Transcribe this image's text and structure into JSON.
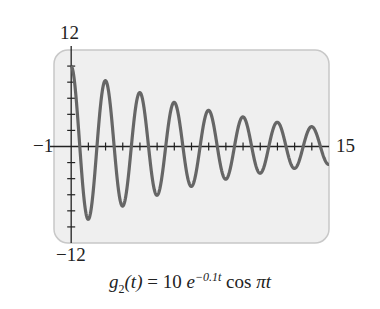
{
  "chart_data": {
    "type": "line",
    "title": "",
    "caption": "g2(t) = 10 e^(-0.1t) cos πt",
    "function": "10*exp(-0.1*t)*cos(pi*t)",
    "xlim": [
      -1,
      15
    ],
    "ylim": [
      -12,
      12
    ],
    "x_tick_step": 1,
    "y_tick_step": 2,
    "tick_labels": {
      "xmin": "−1",
      "xmax": "15",
      "ymax": "12",
      "ymin": "−12"
    },
    "grid": false,
    "colors": {
      "panel": "#efefef",
      "border": "#c8c8c8",
      "curve": "#666666",
      "axis": "#222222"
    }
  },
  "labels": {
    "ymax": "12",
    "ymin": "−12",
    "xmin": "−1",
    "xmax": "15"
  },
  "caption": {
    "g": "g",
    "sub": "2",
    "t": "(t)",
    "eq": " = 10 ",
    "e": "e",
    "exp": "−0.1t",
    "cos": " cos ",
    "pi": "π",
    "t2": "t"
  }
}
